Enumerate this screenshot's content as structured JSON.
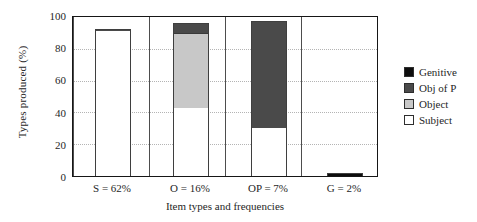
{
  "chart_data": {
    "type": "bar",
    "subtype": "stacked-bar",
    "title": "",
    "xlabel": "Item types and frequencies",
    "ylabel": "Types produced (%)",
    "ylim": [
      0,
      100
    ],
    "yticks": [
      0,
      20,
      40,
      60,
      80,
      100
    ],
    "grid": "horizontal-dotted",
    "legend_position": "right",
    "categories": [
      "S = 62%",
      "O = 16%",
      "OP = 7%",
      "G = 2%"
    ],
    "series": [
      {
        "name": "Subject",
        "color": "#ffffff",
        "values": [
          90,
          42,
          30,
          0
        ]
      },
      {
        "name": "Object",
        "color": "#c8c8c8",
        "values": [
          0,
          47,
          0,
          0
        ]
      },
      {
        "name": "Obj of P",
        "color": "#4a4a4a",
        "values": [
          1.5,
          6,
          66,
          0
        ]
      },
      {
        "name": "Genitive",
        "color": "#0d0d0d",
        "values": [
          0,
          0,
          0,
          2
        ]
      }
    ],
    "bar_totals": [
      91.5,
      95,
      96,
      2
    ],
    "annotations": []
  },
  "axes": {
    "y_title": "Types produced (%)",
    "x_title": "Item types and frequencies",
    "y_ticks": [
      "100",
      "80",
      "60",
      "40",
      "20",
      "0"
    ],
    "x_ticks": [
      "S = 62%",
      "O = 16%",
      "OP = 7%",
      "G = 2%"
    ]
  },
  "legend": {
    "items": [
      {
        "label": "Genitive",
        "color": "#0d0d0d"
      },
      {
        "label": "Obj of P",
        "color": "#4a4a4a"
      },
      {
        "label": "Object",
        "color": "#c8c8c8"
      },
      {
        "label": "Subject",
        "color": "#ffffff"
      }
    ]
  }
}
